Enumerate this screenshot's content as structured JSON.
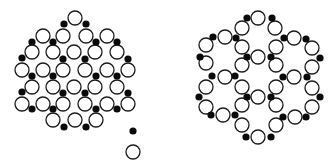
{
  "diagram": {
    "background": "#ffffff",
    "open_color": "#ffffff",
    "open_stroke": "#1a1a1a",
    "filled_color": "#0a0a0a",
    "open_radius": 7,
    "filled_radius": 3.6,
    "structures": [
      {
        "name": "left-cluster",
        "description": "disordered cluster of open and filled atoms",
        "open": [
          [
            75,
            18
          ],
          [
            43,
            36
          ],
          [
            63,
            36
          ],
          [
            86,
            36
          ],
          [
            107,
            36
          ],
          [
            32,
            52
          ],
          [
            53,
            52
          ],
          [
            74,
            52
          ],
          [
            95,
            52
          ],
          [
            117,
            52
          ],
          [
            22,
            70
          ],
          [
            43,
            70
          ],
          [
            63,
            70
          ],
          [
            85,
            70
          ],
          [
            107,
            70
          ],
          [
            128,
            70
          ],
          [
            32,
            87
          ],
          [
            53,
            87
          ],
          [
            74,
            87
          ],
          [
            95,
            87
          ],
          [
            117,
            87
          ],
          [
            22,
            104
          ],
          [
            43,
            104
          ],
          [
            63,
            104
          ],
          [
            85,
            104
          ],
          [
            107,
            104
          ],
          [
            128,
            104
          ],
          [
            53,
            120
          ],
          [
            75,
            120
          ],
          [
            96,
            120
          ]
        ],
        "filled": [
          [
            64,
            24
          ],
          [
            86,
            24
          ],
          [
            32,
            42
          ],
          [
            53,
            42
          ],
          [
            96,
            42
          ],
          [
            117,
            42
          ],
          [
            22,
            58
          ],
          [
            63,
            59
          ],
          [
            85,
            59
          ],
          [
            128,
            59
          ],
          [
            32,
            76
          ],
          [
            53,
            76
          ],
          [
            96,
            76
          ],
          [
            117,
            76
          ],
          [
            22,
            92
          ],
          [
            63,
            93
          ],
          [
            85,
            93
          ],
          [
            128,
            93
          ],
          [
            32,
            109
          ],
          [
            53,
            109
          ],
          [
            96,
            109
          ],
          [
            117,
            109
          ],
          [
            64,
            127
          ],
          [
            86,
            127
          ]
        ]
      },
      {
        "name": "legend-pair",
        "description": "isolated filled atom and open atom",
        "open": [
          [
            133,
            152
          ]
        ],
        "filled": [
          [
            133,
            131
          ]
        ]
      },
      {
        "name": "right-ring-network",
        "description": "seven hexagonal rings arranged in a flower pattern",
        "open": [
          [
            258,
            18
          ],
          [
            242,
            28
          ],
          [
            275,
            28
          ],
          [
            225,
            37
          ],
          [
            294,
            38
          ],
          [
            206,
            45
          ],
          [
            242,
            47
          ],
          [
            276,
            47
          ],
          [
            312,
            48
          ],
          [
            258,
            57
          ],
          [
            206,
            63
          ],
          [
            242,
            65
          ],
          [
            276,
            65
          ],
          [
            312,
            67
          ],
          [
            225,
            77
          ],
          [
            294,
            77
          ],
          [
            206,
            87
          ],
          [
            242,
            87
          ],
          [
            276,
            87
          ],
          [
            312,
            88
          ],
          [
            258,
            97
          ],
          [
            206,
            107
          ],
          [
            242,
            105
          ],
          [
            276,
            105
          ],
          [
            312,
            107
          ],
          [
            223,
            115
          ],
          [
            295,
            117
          ],
          [
            242,
            125
          ],
          [
            276,
            125
          ],
          [
            258,
            137
          ]
        ],
        "filled": [
          [
            247,
            18
          ],
          [
            272,
            18
          ],
          [
            213,
            37
          ],
          [
            236,
            38
          ],
          [
            284,
            38
          ],
          [
            306,
            39
          ],
          [
            200,
            57
          ],
          [
            247,
            57
          ],
          [
            271,
            57
          ],
          [
            320,
            58
          ],
          [
            212,
            76
          ],
          [
            235,
            76
          ],
          [
            283,
            77
          ],
          [
            307,
            77
          ],
          [
            199,
            97
          ],
          [
            247,
            97
          ],
          [
            271,
            97
          ],
          [
            320,
            97
          ],
          [
            211,
            115
          ],
          [
            235,
            115
          ],
          [
            283,
            117
          ],
          [
            306,
            117
          ],
          [
            246,
            137
          ],
          [
            271,
            137
          ]
        ]
      }
    ]
  }
}
